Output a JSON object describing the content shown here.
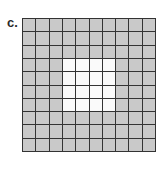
{
  "label": "c.",
  "grid": {
    "rows": 10,
    "cols": 10,
    "shaded_color": "#c9c9c9",
    "unshaded_color": "#fafafa",
    "unshaded_cells": {
      "row_start": 3,
      "row_end": 6,
      "col_start": 3,
      "col_end": 6
    },
    "shaded_count": 84,
    "unshaded_count": 16
  }
}
